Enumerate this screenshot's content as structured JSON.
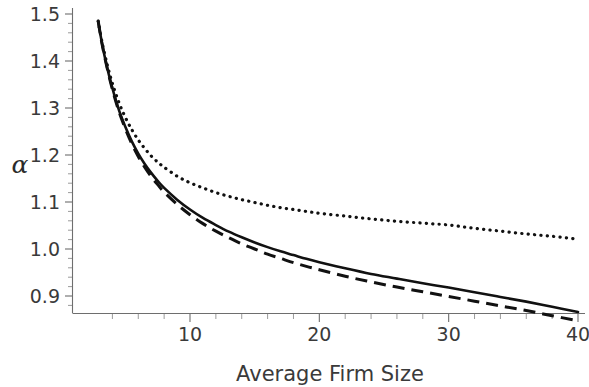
{
  "figure": {
    "title": "",
    "alpha_symbol": "α",
    "background": "#ffffff",
    "ink_color": "#111111",
    "axis_color": "#6e6e6e"
  },
  "chart_data": {
    "type": "line",
    "title": "",
    "subtitle": "",
    "xlabel": "Average Firm Size",
    "ylabel": "α",
    "xlim": [
      2.85,
      40
    ],
    "ylim": [
      0.855,
      1.505
    ],
    "grid": false,
    "legend": "none",
    "x_ticks_major": [
      10,
      20,
      30,
      40
    ],
    "x_tick_labels": [
      "10",
      "20",
      "30",
      "40"
    ],
    "x_ticks_minor_step": 2,
    "y_ticks_major": [
      0.9,
      1.0,
      1.1,
      1.2,
      1.3,
      1.4,
      1.5
    ],
    "y_tick_labels": [
      "0.9",
      "1.0",
      "1.1",
      "1.2",
      "1.3",
      "1.4",
      "1.5"
    ],
    "y_ticks_minor_step": 0.02,
    "x": [
      2.9,
      3.2,
      3.6,
      4.0,
      4.5,
      5.0,
      5.5,
      6.0,
      6.5,
      7.0,
      7.5,
      8.0,
      9.0,
      10.0,
      11.0,
      12.0,
      13.0,
      14.0,
      15.0,
      16.0,
      17.0,
      18.0,
      19.0,
      20.0,
      22.0,
      24.0,
      26.0,
      28.0,
      30.0,
      32.0,
      34.0,
      36.0,
      38.0,
      40.0
    ],
    "series": [
      {
        "name": "dotted",
        "style": "dotted",
        "values": [
          1.485,
          1.44,
          1.392,
          1.352,
          1.312,
          1.28,
          1.254,
          1.232,
          1.214,
          1.198,
          1.185,
          1.174,
          1.155,
          1.141,
          1.13,
          1.12,
          1.112,
          1.105,
          1.099,
          1.093,
          1.088,
          1.084,
          1.08,
          1.076,
          1.07,
          1.064,
          1.059,
          1.055,
          1.051,
          1.044,
          1.038,
          1.032,
          1.027,
          1.021
        ]
      },
      {
        "name": "solid",
        "style": "solid",
        "values": [
          1.485,
          1.437,
          1.385,
          1.342,
          1.296,
          1.26,
          1.229,
          1.203,
          1.181,
          1.162,
          1.145,
          1.13,
          1.105,
          1.084,
          1.066,
          1.051,
          1.037,
          1.025,
          1.014,
          1.004,
          0.995,
          0.987,
          0.979,
          0.972,
          0.959,
          0.947,
          0.937,
          0.927,
          0.918,
          0.908,
          0.898,
          0.888,
          0.877,
          0.866
        ]
      },
      {
        "name": "dashed",
        "style": "dashed",
        "values": [
          1.485,
          1.436,
          1.384,
          1.34,
          1.293,
          1.256,
          1.224,
          1.197,
          1.174,
          1.154,
          1.137,
          1.121,
          1.095,
          1.073,
          1.054,
          1.038,
          1.024,
          1.011,
          1.0,
          0.989,
          0.98,
          0.971,
          0.963,
          0.956,
          0.942,
          0.93,
          0.919,
          0.909,
          0.899,
          0.889,
          0.879,
          0.869,
          0.858,
          0.847
        ]
      }
    ]
  }
}
